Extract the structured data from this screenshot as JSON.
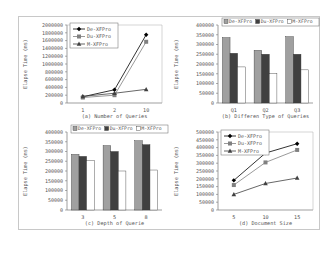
{
  "chart_data": [
    {
      "id": "a",
      "type": "line",
      "caption": "(a) Number of Queries",
      "xlabel": "",
      "ylabel": "Elapse Time (ms)",
      "categories": [
        "1",
        "2",
        "10"
      ],
      "ylim": [
        0,
        2000000
      ],
      "yticks": [
        "0",
        "200000",
        "400000",
        "600000",
        "800000",
        "1000000",
        "1200000",
        "1400000",
        "1600000",
        "1800000",
        "2000000"
      ],
      "legend_position": "top-left",
      "series": [
        {
          "name": "De-XFPro",
          "marker": "diamond",
          "color": "#000000",
          "values": [
            160000,
            340000,
            1750000
          ]
        },
        {
          "name": "Du-XFPro",
          "marker": "square",
          "color": "#808080",
          "values": [
            140000,
            200000,
            1570000
          ]
        },
        {
          "name": "M-XFPro",
          "marker": "triangle",
          "color": "#404040",
          "values": [
            170000,
            250000,
            350000
          ]
        }
      ]
    },
    {
      "id": "b",
      "type": "bar",
      "caption": "(b) Differen Type of Queries",
      "xlabel": "",
      "ylabel": "Elapse Time (ms)",
      "categories": [
        "Q1",
        "Q2",
        "Q3"
      ],
      "ylim": [
        0,
        400000
      ],
      "yticks": [
        "0",
        "50000",
        "100000",
        "150000",
        "200000",
        "250000",
        "300000",
        "350000",
        "400000"
      ],
      "legend_position": "top",
      "series": [
        {
          "name": "De-XFPro",
          "fill": "#a0a0a0",
          "values": [
            335000,
            270000,
            340000
          ]
        },
        {
          "name": "Du-XFPro",
          "fill": "#404040",
          "values": [
            255000,
            250000,
            250000
          ]
        },
        {
          "name": "M-XFPro",
          "fill": "#ffffff",
          "values": [
            185000,
            150000,
            170000
          ]
        }
      ]
    },
    {
      "id": "c",
      "type": "bar",
      "caption": "(c) Depth of Querie",
      "xlabel": "",
      "ylabel": "Elapse Time (ms)",
      "categories": [
        "3",
        "5",
        "8"
      ],
      "ylim": [
        0,
        400000
      ],
      "yticks": [
        "0",
        "50000",
        "100000",
        "150000",
        "200000",
        "250000",
        "300000",
        "350000",
        "400000"
      ],
      "legend_position": "top",
      "series": [
        {
          "name": "De-XFPro",
          "fill": "#a0a0a0",
          "values": [
            285000,
            330000,
            355000
          ]
        },
        {
          "name": "Du-XFPro",
          "fill": "#404040",
          "values": [
            275000,
            300000,
            335000
          ]
        },
        {
          "name": "M-XFPro",
          "fill": "#ffffff",
          "values": [
            255000,
            200000,
            205000
          ]
        }
      ]
    },
    {
      "id": "d",
      "type": "line",
      "caption": "(d) Document Size",
      "xlabel": "",
      "ylabel": "Elapse Time (ms)",
      "categories": [
        "5",
        "10",
        "15"
      ],
      "ylim": [
        0,
        500000
      ],
      "yticks": [
        "0",
        "50000",
        "100000",
        "150000",
        "200000",
        "250000",
        "300000",
        "350000",
        "400000",
        "450000",
        "500000"
      ],
      "legend_position": "top-left",
      "series": [
        {
          "name": "De-XFPro",
          "marker": "diamond",
          "color": "#000000",
          "values": [
            190000,
            365000,
            425000
          ]
        },
        {
          "name": "Du-XFPro",
          "marker": "square",
          "color": "#808080",
          "values": [
            160000,
            305000,
            385000
          ]
        },
        {
          "name": "M-XFPro",
          "marker": "triangle",
          "color": "#404040",
          "values": [
            100000,
            170000,
            205000
          ]
        }
      ]
    }
  ]
}
